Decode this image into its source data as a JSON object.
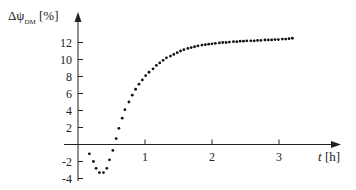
{
  "chart_data": {
    "type": "scatter",
    "title": "",
    "ylabel_symbol": "Δψ",
    "ylabel_sub": "DM",
    "ylabel_unit": "[%]",
    "xlabel_symbol": "t",
    "xlabel_unit": "[h]",
    "xlim": [
      0,
      3.5
    ],
    "ylim": [
      -4,
      14
    ],
    "x_ticks": [
      "1",
      "2",
      "3"
    ],
    "y_ticks": [
      "12",
      "10",
      "8",
      "6",
      "4",
      "2",
      "-2",
      "-4"
    ],
    "grid": false,
    "legend": null,
    "points": [
      [
        0.17,
        -1.1
      ],
      [
        0.23,
        -2.0
      ],
      [
        0.27,
        -2.8
      ],
      [
        0.32,
        -3.3
      ],
      [
        0.38,
        -3.3
      ],
      [
        0.43,
        -2.8
      ],
      [
        0.47,
        -1.8
      ],
      [
        0.52,
        -0.7
      ],
      [
        0.57,
        0.7
      ],
      [
        0.61,
        1.9
      ],
      [
        0.66,
        3.1
      ],
      [
        0.7,
        4.1
      ],
      [
        0.76,
        5.0
      ],
      [
        0.81,
        5.8
      ],
      [
        0.86,
        6.5
      ],
      [
        0.91,
        7.1
      ],
      [
        0.96,
        7.6
      ],
      [
        1.01,
        8.1
      ],
      [
        1.06,
        8.5
      ],
      [
        1.12,
        8.9
      ],
      [
        1.17,
        9.3
      ],
      [
        1.22,
        9.6
      ],
      [
        1.27,
        9.9
      ],
      [
        1.32,
        10.2
      ],
      [
        1.38,
        10.4
      ],
      [
        1.43,
        10.6
      ],
      [
        1.48,
        10.8
      ],
      [
        1.53,
        11.0
      ],
      [
        1.58,
        11.15
      ],
      [
        1.64,
        11.3
      ],
      [
        1.69,
        11.4
      ],
      [
        1.74,
        11.5
      ],
      [
        1.79,
        11.6
      ],
      [
        1.85,
        11.7
      ],
      [
        1.9,
        11.75
      ],
      [
        1.95,
        11.8
      ],
      [
        2.0,
        11.85
      ],
      [
        2.05,
        11.9
      ],
      [
        2.11,
        11.95
      ],
      [
        2.16,
        12.0
      ],
      [
        2.21,
        12.0
      ],
      [
        2.26,
        12.05
      ],
      [
        2.32,
        12.1
      ],
      [
        2.37,
        12.1
      ],
      [
        2.42,
        12.15
      ],
      [
        2.47,
        12.15
      ],
      [
        2.52,
        12.2
      ],
      [
        2.58,
        12.2
      ],
      [
        2.63,
        12.2
      ],
      [
        2.68,
        12.25
      ],
      [
        2.73,
        12.25
      ],
      [
        2.79,
        12.3
      ],
      [
        2.84,
        12.3
      ],
      [
        2.89,
        12.3
      ],
      [
        2.94,
        12.35
      ],
      [
        2.99,
        12.35
      ],
      [
        3.05,
        12.4
      ],
      [
        3.1,
        12.4
      ],
      [
        3.15,
        12.45
      ],
      [
        3.2,
        12.5
      ]
    ]
  },
  "axis_color": "#222222",
  "point_color": "#111111"
}
